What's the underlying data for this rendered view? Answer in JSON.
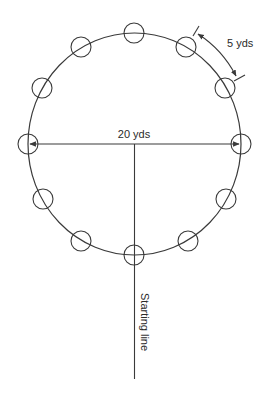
{
  "diagram": {
    "colors": {
      "stroke": "#3a3a3a",
      "text": "#2a2a2a",
      "background": "#ffffff"
    },
    "track": {
      "cx": 134.5,
      "cy": 144,
      "rx": 106.5,
      "ry": 111
    },
    "markers": {
      "count": 12,
      "radius": 10,
      "positions": [
        {
          "x": 134,
          "y": 33
        },
        {
          "x": 186,
          "y": 47
        },
        {
          "x": 225,
          "y": 88
        },
        {
          "x": 241,
          "y": 144
        },
        {
          "x": 226,
          "y": 199
        },
        {
          "x": 188,
          "y": 241
        },
        {
          "x": 134,
          "y": 255
        },
        {
          "x": 81,
          "y": 241
        },
        {
          "x": 43,
          "y": 199
        },
        {
          "x": 28,
          "y": 144
        },
        {
          "x": 42,
          "y": 88
        },
        {
          "x": 81,
          "y": 47
        }
      ]
    },
    "labels": {
      "diameter": "20 yds",
      "spacing": "5 yds",
      "start": "Starting line"
    }
  }
}
